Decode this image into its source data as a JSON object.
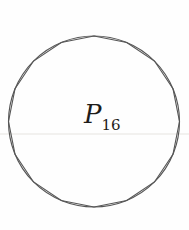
{
  "figure": {
    "type": "circle-with-inscribed-regular-polygon",
    "label_main": "P",
    "label_subscript": "16",
    "polygon_sides": 16,
    "colors": {
      "stroke": "#565656",
      "background": "#fefefe",
      "faint_rule": "#e6e4e0",
      "label_text": "#1e1c1a"
    },
    "geometry": {
      "center_x": 94,
      "center_y": 121.5,
      "radius": 85.5,
      "vertex_start_angle_deg": 0,
      "faint_rule_y": 134,
      "canvas_width": 189,
      "canvas_height": 230
    }
  }
}
